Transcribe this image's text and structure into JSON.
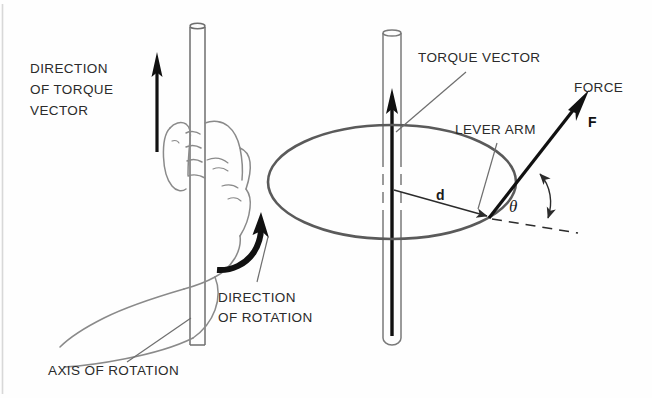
{
  "figure": {
    "background_color": "#fefefe",
    "ink_color": "#2b2b2b",
    "bold_ink_color": "#111111",
    "labels": {
      "direction_of_torque_vector_line1": "DIRECTION",
      "direction_of_torque_vector_line2": "OF TORQUE",
      "direction_of_torque_vector_line3": "VECTOR",
      "direction_of_rotation_line1": "DIRECTION",
      "direction_of_rotation_line2": "OF ROTATION",
      "axis_of_rotation": "AXIS OF ROTATION",
      "torque_vector": "TORQUE VECTOR",
      "lever_arm": "LEVER ARM",
      "force": "FORCE",
      "force_symbol": "F",
      "lever_arm_symbol": "d",
      "angle_symbol": "θ"
    },
    "panels": {
      "left": {
        "name": "right-hand-rule-illustration",
        "description": "Hand gripping vertical rod with thumb up, curved rotation arrow"
      },
      "right": {
        "name": "torque-vector-diagram",
        "description": "Rod through elliptical disc with torque vector, lever arm d, force F at angle theta"
      }
    }
  }
}
